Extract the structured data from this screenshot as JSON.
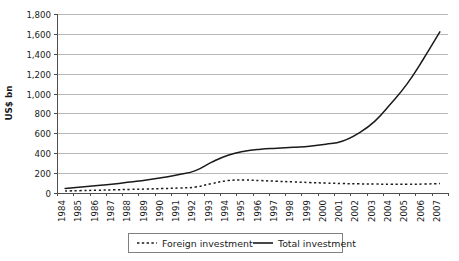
{
  "chart_data": {
    "type": "line",
    "title": "",
    "xlabel": "",
    "ylabel": "US$ bn",
    "ylim": [
      0,
      1800
    ],
    "ytick_step": 200,
    "grid": true,
    "legend_position": "bottom",
    "yticks": [
      "0",
      "200",
      "400",
      "600",
      "800",
      "1,000",
      "1,200",
      "1,400",
      "1,600",
      "1,800"
    ],
    "categories": [
      "1984",
      "1985",
      "1986",
      "1987",
      "1988",
      "1989",
      "1990",
      "1991",
      "1992",
      "1993",
      "1994",
      "1995",
      "1996",
      "1997",
      "1998",
      "1999",
      "2000",
      "2001",
      "2002",
      "2003",
      "2004",
      "2005",
      "2006",
      "2007"
    ],
    "series": [
      {
        "name": "Foreign investment",
        "style": "dashed",
        "color": "#1a1a1a",
        "values": [
          20,
          24,
          28,
          32,
          36,
          40,
          45,
          50,
          60,
          95,
          125,
          130,
          125,
          118,
          112,
          105,
          100,
          95,
          92,
          90,
          88,
          88,
          90,
          95
        ]
      },
      {
        "name": "Total investment",
        "style": "solid",
        "color": "#1a1a1a",
        "values": [
          45,
          60,
          75,
          90,
          110,
          130,
          155,
          185,
          225,
          310,
          380,
          420,
          440,
          450,
          460,
          470,
          490,
          520,
          600,
          720,
          900,
          1100,
          1350,
          1620
        ]
      }
    ]
  },
  "legend": {
    "items": [
      {
        "label": "Foreign investment",
        "style": "dashed"
      },
      {
        "label": "Total investment",
        "style": "solid"
      }
    ]
  }
}
